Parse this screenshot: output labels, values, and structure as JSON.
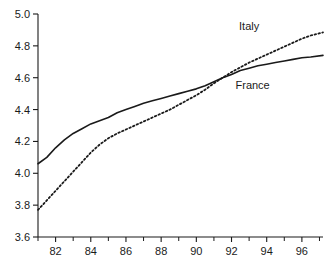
{
  "chart_data": {
    "type": "line",
    "title": "",
    "subtitle": "",
    "xlabel": "",
    "ylabel": "",
    "xlim": [
      81,
      97.2
    ],
    "ylim": [
      3.6,
      5.0
    ],
    "grid": false,
    "legend_position": "inline-annotations",
    "x_ticks": [
      "82",
      "84",
      "86",
      "88",
      "90",
      "92",
      "94",
      "96"
    ],
    "x_tick_values": [
      82,
      84,
      86,
      88,
      90,
      92,
      94,
      96
    ],
    "x_minor_tick_values": [
      81,
      83,
      85,
      87,
      89,
      91,
      93,
      95,
      97
    ],
    "y_ticks": [
      "3.6",
      "3.8",
      "4.0",
      "4.2",
      "4.4",
      "4.6",
      "4.8",
      "5.0"
    ],
    "y_tick_values": [
      3.6,
      3.8,
      4.0,
      4.2,
      4.4,
      4.6,
      4.8,
      5.0
    ],
    "x": [
      81,
      81.5,
      82,
      82.5,
      83,
      83.5,
      84,
      84.5,
      85,
      85.5,
      86,
      86.5,
      87,
      87.5,
      88,
      88.5,
      89,
      89.5,
      90,
      90.5,
      91,
      91.5,
      92,
      92.5,
      93,
      93.5,
      94,
      94.5,
      95,
      95.5,
      96,
      96.5,
      97.2
    ],
    "series": [
      {
        "name": "France",
        "style": "solid",
        "color": "#1a1a1a",
        "label": "France",
        "label_x": 93.2,
        "label_y": 4.53,
        "values": [
          4.06,
          4.1,
          4.16,
          4.21,
          4.25,
          4.28,
          4.31,
          4.33,
          4.35,
          4.38,
          4.4,
          4.42,
          4.44,
          4.455,
          4.47,
          4.485,
          4.5,
          4.515,
          4.53,
          4.55,
          4.575,
          4.6,
          4.62,
          4.645,
          4.66,
          4.675,
          4.685,
          4.695,
          4.705,
          4.715,
          4.725,
          4.73,
          4.74
        ]
      },
      {
        "name": "Italy",
        "style": "dotted",
        "color": "#1a1a1a",
        "label": "Italy",
        "label_x": 93.0,
        "label_y": 4.9,
        "values": [
          3.77,
          3.83,
          3.89,
          3.95,
          4.01,
          4.07,
          4.13,
          4.18,
          4.22,
          4.25,
          4.275,
          4.3,
          4.325,
          4.35,
          4.375,
          4.4,
          4.43,
          4.46,
          4.49,
          4.525,
          4.565,
          4.6,
          4.635,
          4.665,
          4.695,
          4.72,
          4.745,
          4.77,
          4.795,
          4.82,
          4.845,
          4.865,
          4.885
        ]
      }
    ]
  }
}
